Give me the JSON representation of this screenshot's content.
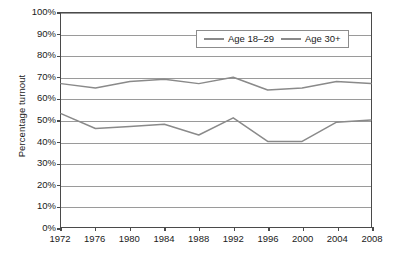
{
  "chart_data": {
    "type": "line",
    "title": "",
    "xlabel": "",
    "ylabel": "Percentage turnout",
    "x": [
      1972,
      1976,
      1980,
      1984,
      1988,
      1992,
      1996,
      2000,
      2004,
      2008
    ],
    "xticklabels": [
      "1972",
      "1976",
      "1980",
      "1984",
      "1988",
      "1992",
      "1996",
      "2000",
      "2004",
      "2008"
    ],
    "xlim": [
      1972,
      2008
    ],
    "ylim": [
      0,
      100
    ],
    "yticks": [
      0,
      10,
      20,
      30,
      40,
      50,
      60,
      70,
      80,
      90,
      100
    ],
    "yticklabels": [
      "0%",
      "10%",
      "20%",
      "30%",
      "40%",
      "50%",
      "60%",
      "70%",
      "80%",
      "90%",
      "100%"
    ],
    "grid": true,
    "grid_axis": "y",
    "legend_position": "upper center",
    "series": [
      {
        "name": "Age 18-29",
        "color": "#8a8a8a",
        "values": [
          53,
          46,
          47,
          48,
          43,
          51,
          40,
          40,
          49,
          50
        ]
      },
      {
        "name": "Age 30+",
        "color": "#8a8a8a",
        "values": [
          67,
          65,
          68,
          69,
          67,
          70,
          64,
          65,
          68,
          67
        ]
      }
    ]
  },
  "legend": {
    "items": [
      {
        "label": "Age 18–29"
      },
      {
        "label": "Age 30+"
      }
    ]
  },
  "caption": {
    "text": ""
  }
}
